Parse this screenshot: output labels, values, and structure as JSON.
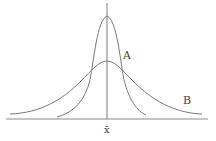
{
  "diagram": {
    "type": "normal-distribution-comparison",
    "curves": [
      {
        "label": "A",
        "description": "narrow, tall bell curve (small spread)",
        "peak_y": 16
      },
      {
        "label": "B",
        "description": "wide, flat bell curve (large spread)",
        "peak_y": 61
      }
    ],
    "axis_label": "x̄",
    "colors": {
      "line": "#7a7a7a",
      "text": "#444444",
      "background": "#ffffff"
    }
  }
}
